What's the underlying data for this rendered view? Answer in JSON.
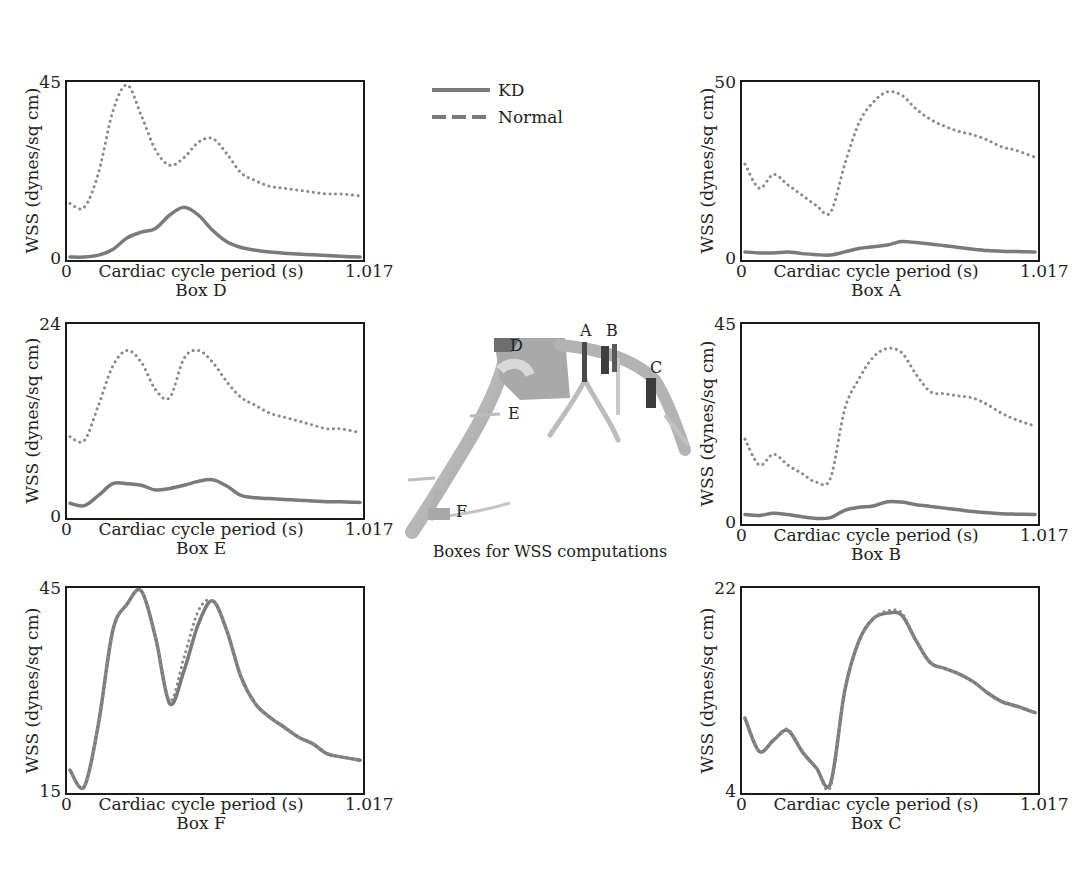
{
  "legend": {
    "items": [
      {
        "label": "KD",
        "style": "solid"
      },
      {
        "label": "Normal",
        "style": "dashed"
      }
    ]
  },
  "colors": {
    "kd": "#7a7a7a",
    "normal": "#8a8a8a",
    "frame": "#1a1a1a"
  },
  "diagram": {
    "caption": "Boxes for WSS computations",
    "labels": [
      "A",
      "B",
      "C",
      "D",
      "E",
      "F"
    ]
  },
  "panels": [
    {
      "id": "D",
      "title": "Box D",
      "ymin": "0",
      "ymax": "45",
      "xmin": "0",
      "xmax": "1.017",
      "xlabel": "Cardiac cycle period (s)",
      "ylabel": "WSS (dynes/sq cm)"
    },
    {
      "id": "A",
      "title": "Box A",
      "ymin": "0",
      "ymax": "50",
      "xmin": "0",
      "xmax": "1.017",
      "xlabel": "Cardiac cycle period (s)",
      "ylabel": "WSS (dynes/sq cm)"
    },
    {
      "id": "E",
      "title": "Box E",
      "ymin": "0",
      "ymax": "24",
      "xmin": "0",
      "xmax": "1.017",
      "xlabel": "Cardiac cycle period (s)",
      "ylabel": "WSS (dynes/sq cm)"
    },
    {
      "id": "B",
      "title": "Box B",
      "ymin": "0",
      "ymax": "45",
      "xmin": "0",
      "xmax": "1.017",
      "xlabel": "Cardiac cycle period (s)",
      "ylabel": "WSS (dynes/sq cm)"
    },
    {
      "id": "F",
      "title": "Box F",
      "ymin": "15",
      "ymax": "45",
      "xmin": "0",
      "xmax": "1.017",
      "xlabel": "Cardiac cycle period (s)",
      "ylabel": "WSS (dynes/sq cm)"
    },
    {
      "id": "C",
      "title": "Box C",
      "ymin": "4",
      "ymax": "22",
      "xmin": "0",
      "xmax": "1.017",
      "xlabel": "Cardiac cycle period (s)",
      "ylabel": "WSS (dynes/sq cm)"
    }
  ],
  "chart_data": [
    {
      "type": "line",
      "title": "Box D",
      "xlabel": "Cardiac cycle period (s)",
      "ylabel": "WSS (dynes/sq cm)",
      "xlim": [
        0,
        1.017
      ],
      "ylim": [
        0,
        45
      ],
      "x": [
        0,
        0.05,
        0.1,
        0.15,
        0.2,
        0.25,
        0.3,
        0.35,
        0.4,
        0.45,
        0.5,
        0.55,
        0.6,
        0.65,
        0.7,
        0.75,
        0.8,
        0.85,
        0.9,
        0.95,
        1.017
      ],
      "series": [
        {
          "name": "Normal",
          "style": "dashed",
          "values": [
            14,
            13,
            22,
            38,
            45,
            37,
            28,
            24,
            26,
            30,
            31,
            27,
            22,
            20,
            18.5,
            18,
            17.5,
            17,
            16.5,
            16.5,
            16
          ]
        },
        {
          "name": "KD",
          "style": "solid",
          "values": [
            0,
            0,
            0.5,
            2,
            5,
            6.5,
            7.5,
            11,
            13,
            11,
            7,
            4,
            2.5,
            1.8,
            1.3,
            1.0,
            0.8,
            0.6,
            0.4,
            0.2,
            0
          ]
        }
      ],
      "legend": [
        "KD",
        "Normal"
      ],
      "grid": false
    },
    {
      "type": "line",
      "title": "Box A",
      "xlabel": "Cardiac cycle period (s)",
      "ylabel": "WSS (dynes/sq cm)",
      "xlim": [
        0,
        1.017
      ],
      "ylim": [
        0,
        50
      ],
      "x": [
        0,
        0.05,
        0.1,
        0.15,
        0.2,
        0.25,
        0.3,
        0.35,
        0.4,
        0.45,
        0.5,
        0.55,
        0.6,
        0.65,
        0.7,
        0.75,
        0.8,
        0.85,
        0.9,
        0.95,
        1.017
      ],
      "series": [
        {
          "name": "Normal",
          "style": "dashed",
          "values": [
            27,
            20,
            24,
            21,
            18,
            15,
            13,
            27,
            39,
            45,
            48,
            47,
            43,
            40,
            38,
            36.5,
            35.5,
            34,
            32,
            31,
            29
          ]
        },
        {
          "name": "KD",
          "style": "solid",
          "values": [
            1.5,
            1.2,
            1.2,
            1.5,
            1.0,
            0.7,
            0.6,
            1.5,
            2.5,
            3.0,
            3.5,
            4.5,
            4.2,
            3.8,
            3.3,
            2.8,
            2.3,
            1.9,
            1.7,
            1.6,
            1.5
          ]
        }
      ],
      "legend": [
        "KD",
        "Normal"
      ],
      "grid": false
    },
    {
      "type": "line",
      "title": "Box E",
      "xlabel": "Cardiac cycle period (s)",
      "ylabel": "WSS (dynes/sq cm)",
      "xlim": [
        0,
        1.017
      ],
      "ylim": [
        0,
        24
      ],
      "x": [
        0,
        0.05,
        0.1,
        0.15,
        0.2,
        0.25,
        0.3,
        0.35,
        0.4,
        0.45,
        0.5,
        0.55,
        0.6,
        0.65,
        0.7,
        0.75,
        0.8,
        0.85,
        0.9,
        0.95,
        1.017
      ],
      "series": [
        {
          "name": "Normal",
          "style": "dashed",
          "values": [
            10,
            9.5,
            14,
            19,
            21,
            19.5,
            16,
            15,
            20,
            21,
            19.5,
            17,
            15,
            14,
            13,
            12.5,
            12,
            11.5,
            11,
            11,
            10.5
          ]
        },
        {
          "name": "KD",
          "style": "solid",
          "values": [
            1.5,
            1.2,
            2.5,
            4,
            4,
            3.8,
            3.2,
            3.4,
            3.8,
            4.3,
            4.5,
            3.7,
            2.5,
            2.2,
            2.1,
            2.0,
            1.9,
            1.8,
            1.7,
            1.7,
            1.6
          ]
        }
      ],
      "legend": [
        "KD",
        "Normal"
      ],
      "grid": false
    },
    {
      "type": "line",
      "title": "Box B",
      "xlabel": "Cardiac cycle period (s)",
      "ylabel": "WSS (dynes/sq cm)",
      "xlim": [
        0,
        1.017
      ],
      "ylim": [
        0,
        45
      ],
      "x": [
        0,
        0.05,
        0.1,
        0.15,
        0.2,
        0.25,
        0.3,
        0.35,
        0.4,
        0.45,
        0.5,
        0.55,
        0.6,
        0.65,
        0.7,
        0.75,
        0.8,
        0.85,
        0.9,
        0.95,
        1.017
      ],
      "series": [
        {
          "name": "Normal",
          "style": "dashed",
          "values": [
            19,
            13,
            15.5,
            13,
            11,
            9,
            10,
            26,
            33,
            38,
            40,
            39,
            34,
            30,
            29.5,
            29,
            28.5,
            27,
            25,
            23.5,
            22
          ]
        },
        {
          "name": "KD",
          "style": "solid",
          "values": [
            1.5,
            1.3,
            1.8,
            1.5,
            1.0,
            0.6,
            0.8,
            2.5,
            3.2,
            3.5,
            4.5,
            4.4,
            3.8,
            3.4,
            3.0,
            2.6,
            2.2,
            1.9,
            1.7,
            1.6,
            1.5
          ]
        }
      ],
      "legend": [
        "KD",
        "Normal"
      ],
      "grid": false
    },
    {
      "type": "line",
      "title": "Box F",
      "xlabel": "Cardiac cycle period (s)",
      "ylabel": "WSS (dynes/sq cm)",
      "xlim": [
        0,
        1.017
      ],
      "ylim": [
        15,
        45
      ],
      "x": [
        0,
        0.05,
        0.1,
        0.15,
        0.2,
        0.25,
        0.3,
        0.35,
        0.4,
        0.45,
        0.5,
        0.55,
        0.6,
        0.65,
        0.7,
        0.75,
        0.8,
        0.85,
        0.9,
        0.95,
        1.017
      ],
      "series": [
        {
          "name": "Normal",
          "style": "dashed",
          "values": [
            18,
            15.5,
            25,
            39,
            43,
            45,
            38,
            28.5,
            35,
            42,
            43.5,
            39,
            32,
            28,
            26,
            24.5,
            23,
            22,
            20.5,
            20,
            19.5
          ]
        },
        {
          "name": "KD",
          "style": "solid",
          "values": [
            18,
            15.5,
            25,
            39,
            43,
            45,
            38,
            28,
            33,
            40,
            43.5,
            39,
            32,
            28,
            26,
            24.5,
            23,
            22,
            20.5,
            20,
            19.5
          ]
        }
      ],
      "legend": [
        "KD",
        "Normal"
      ],
      "grid": false
    },
    {
      "type": "line",
      "title": "Box C",
      "xlabel": "Cardiac cycle period (s)",
      "ylabel": "WSS (dynes/sq cm)",
      "xlim": [
        0,
        1.017
      ],
      "ylim": [
        4,
        22
      ],
      "x": [
        0,
        0.05,
        0.1,
        0.15,
        0.2,
        0.25,
        0.3,
        0.35,
        0.4,
        0.45,
        0.5,
        0.55,
        0.6,
        0.65,
        0.7,
        0.75,
        0.8,
        0.85,
        0.9,
        0.95,
        1.017
      ],
      "series": [
        {
          "name": "Normal",
          "style": "dashed",
          "values": [
            10.5,
            7.5,
            8.5,
            9.5,
            7.5,
            6.0,
            4.3,
            13,
            17.5,
            19.5,
            20.2,
            20.0,
            17.5,
            15.5,
            15,
            14.5,
            13.8,
            12.8,
            12,
            11.6,
            11
          ]
        },
        {
          "name": "KD",
          "style": "solid",
          "values": [
            10.5,
            7.5,
            8.5,
            9.4,
            7.5,
            6.0,
            4.6,
            13,
            17.5,
            19.5,
            20.0,
            19.8,
            17.5,
            15.5,
            15,
            14.5,
            13.8,
            12.8,
            12,
            11.6,
            11
          ]
        }
      ],
      "legend": [
        "KD",
        "Normal"
      ],
      "grid": false
    }
  ]
}
